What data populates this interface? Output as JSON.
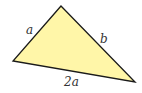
{
  "diagram": {
    "type": "triangle",
    "fill_color": "#fff6a8",
    "stroke_color": "#1a1a1a",
    "vertices": {
      "top": [
        61,
        6
      ],
      "left": [
        13,
        61
      ],
      "right": [
        135,
        82
      ]
    },
    "labels": {
      "left_side": "a",
      "right_side": "b",
      "bottom_side": "2a"
    }
  }
}
